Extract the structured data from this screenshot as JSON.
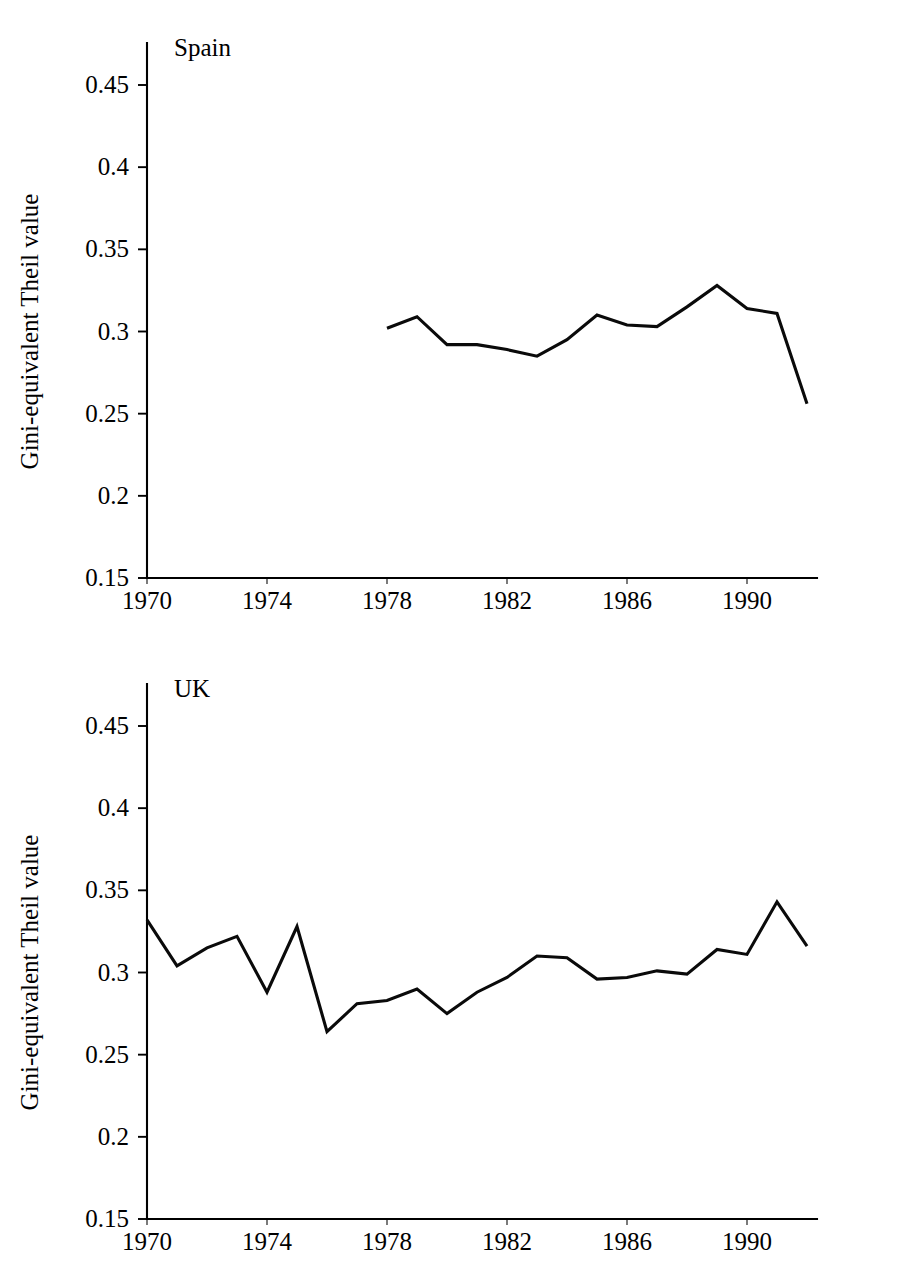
{
  "figure": {
    "ylabel": "Gini-equivalent Theil value",
    "xlabel": "",
    "line_color": "#000000",
    "background_color": "#ffffff"
  },
  "axis": {
    "ytick_labels": [
      "0.45",
      "0.4",
      "0.35",
      "0.3",
      "0.25",
      "0.2",
      "0.15"
    ],
    "ytick_values": [
      0.45,
      0.4,
      0.35,
      0.3,
      0.25,
      0.2,
      0.15
    ],
    "xtick_labels": [
      "1970",
      "1974",
      "1978",
      "1982",
      "1986",
      "1990"
    ],
    "xtick_values": [
      1970,
      1974,
      1978,
      1982,
      1986,
      1990
    ]
  },
  "chart_data": [
    {
      "type": "line",
      "title": "Spain",
      "xlabel": "",
      "ylabel": "Gini-equivalent Theil value",
      "ylim": [
        0.15,
        0.45
      ],
      "xlim": [
        1970,
        1992
      ],
      "grid": false,
      "legend": "none",
      "x": [
        1978,
        1979,
        1980,
        1981,
        1982,
        1983,
        1984,
        1985,
        1986,
        1987,
        1988,
        1989,
        1990,
        1991,
        1992
      ],
      "values": [
        0.302,
        0.309,
        0.292,
        0.292,
        0.289,
        0.285,
        0.295,
        0.31,
        0.304,
        0.303,
        0.315,
        0.328,
        0.314,
        0.311,
        0.256
      ],
      "series": [
        {
          "name": "Spain",
          "values": [
            0.302,
            0.309,
            0.292,
            0.292,
            0.289,
            0.285,
            0.295,
            0.31,
            0.304,
            0.303,
            0.315,
            0.328,
            0.314,
            0.311,
            0.256
          ]
        }
      ]
    },
    {
      "type": "line",
      "title": "UK",
      "xlabel": "",
      "ylabel": "Gini-equivalent Theil value",
      "ylim": [
        0.15,
        0.45
      ],
      "xlim": [
        1970,
        1992
      ],
      "grid": false,
      "legend": "none",
      "x": [
        1970,
        1971,
        1972,
        1973,
        1974,
        1975,
        1976,
        1977,
        1978,
        1979,
        1980,
        1981,
        1982,
        1983,
        1984,
        1985,
        1986,
        1987,
        1988,
        1989,
        1990,
        1991,
        1992
      ],
      "values": [
        0.332,
        0.304,
        0.315,
        0.322,
        0.288,
        0.328,
        0.264,
        0.281,
        0.283,
        0.29,
        0.275,
        0.288,
        0.297,
        0.31,
        0.309,
        0.296,
        0.297,
        0.301,
        0.299,
        0.314,
        0.311,
        0.343,
        0.316
      ],
      "series": [
        {
          "name": "UK",
          "values": [
            0.332,
            0.304,
            0.315,
            0.322,
            0.288,
            0.328,
            0.264,
            0.281,
            0.283,
            0.29,
            0.275,
            0.288,
            0.297,
            0.31,
            0.309,
            0.296,
            0.297,
            0.301,
            0.299,
            0.314,
            0.311,
            0.343,
            0.316
          ]
        }
      ]
    }
  ]
}
